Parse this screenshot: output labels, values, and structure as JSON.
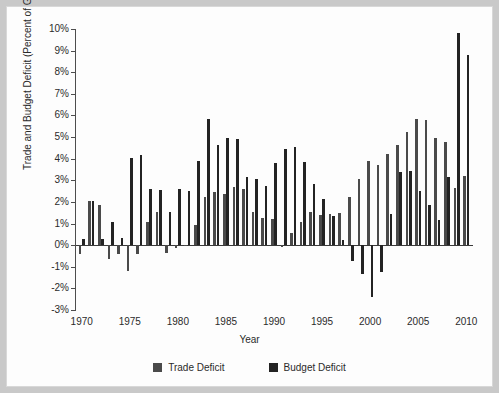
{
  "chart_data": {
    "type": "bar",
    "title": "",
    "xlabel": "Year",
    "ylabel": "Trade and Budget Deficit (Percent of GDP)",
    "xlim": [
      1969.3,
      2010.7
    ],
    "ylim": [
      -3,
      10
    ],
    "grid": false,
    "legend_position": "bottom",
    "y_tick_labels": [
      "10%",
      "9%",
      "8%",
      "7%",
      "6%",
      "5%",
      "4%",
      "3%",
      "2%",
      "1%",
      "0%",
      "-1%",
      "-2%",
      "-3%"
    ],
    "y_ticks": [
      10,
      9,
      8,
      7,
      6,
      5,
      4,
      3,
      2,
      1,
      0,
      -1,
      -2,
      -3
    ],
    "x_tick_labels": [
      "1970",
      "1975",
      "1980",
      "1985",
      "1990",
      "1995",
      "2000",
      "2005",
      "2010"
    ],
    "x_ticks": [
      1970,
      1975,
      1980,
      1985,
      1990,
      1995,
      2000,
      2005,
      2010
    ],
    "categories": [
      1970,
      1971,
      1972,
      1973,
      1974,
      1975,
      1976,
      1977,
      1978,
      1979,
      1980,
      1981,
      1982,
      1983,
      1984,
      1985,
      1986,
      1987,
      1988,
      1989,
      1990,
      1991,
      1992,
      1993,
      1994,
      1995,
      1996,
      1997,
      1998,
      1999,
      2000,
      2001,
      2002,
      2003,
      2004,
      2005,
      2006,
      2007,
      2008,
      2009,
      2010
    ],
    "series": [
      {
        "name": "Trade Deficit",
        "color": "#4a4a4a",
        "values": [
          -0.4,
          2.05,
          1.85,
          -0.65,
          -0.4,
          -1.2,
          -0.4,
          1.05,
          1.55,
          -0.35,
          -0.15,
          0.0,
          0.95,
          2.25,
          2.45,
          2.35,
          2.7,
          2.6,
          1.55,
          1.25,
          1.2,
          -0.1,
          0.55,
          1.05,
          1.55,
          1.4,
          1.45,
          1.5,
          2.25,
          3.05,
          3.9,
          3.7,
          4.2,
          4.65,
          5.25,
          5.85,
          5.8,
          4.95,
          4.75,
          2.65,
          3.2
        ]
      },
      {
        "name": "Budget Deficit",
        "color": "#232323",
        "values": [
          0.3,
          2.05,
          0.3,
          1.05,
          0.35,
          4.05,
          4.15,
          2.6,
          2.55,
          1.55,
          2.6,
          2.5,
          3.9,
          5.85,
          4.65,
          4.95,
          4.9,
          3.15,
          3.05,
          2.75,
          3.8,
          4.45,
          4.55,
          3.85,
          2.85,
          2.15,
          1.35,
          0.25,
          -0.75,
          -1.35,
          -2.4,
          -1.25,
          1.45,
          3.4,
          3.45,
          2.5,
          1.85,
          1.15,
          3.15,
          9.8,
          8.8
        ]
      }
    ],
    "legend": [
      {
        "label": "Trade Deficit",
        "color": "#4a4a4a"
      },
      {
        "label": "Budget Deficit",
        "color": "#232323"
      }
    ]
  }
}
